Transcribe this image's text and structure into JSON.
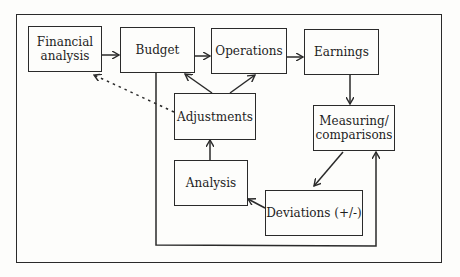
{
  "diagram": {
    "type": "flowchart",
    "nodes": {
      "financial_analysis": "Financial analysis",
      "budget": "Budget",
      "operations": "Operations",
      "earnings": "Earnings",
      "adjustments": "Adjustments",
      "measuring": "Measuring/ comparisons",
      "analysis": "Analysis",
      "deviations": "Deviations (+/-)"
    },
    "edges": [
      {
        "from": "Financial analysis",
        "to": "Budget",
        "style": "solid"
      },
      {
        "from": "Budget",
        "to": "Operations",
        "style": "solid"
      },
      {
        "from": "Operations",
        "to": "Earnings",
        "style": "solid"
      },
      {
        "from": "Earnings",
        "to": "Measuring/ comparisons",
        "style": "solid"
      },
      {
        "from": "Measuring/ comparisons",
        "to": "Deviations (+/-)",
        "style": "solid"
      },
      {
        "from": "Deviations (+/-)",
        "to": "Analysis",
        "style": "solid"
      },
      {
        "from": "Analysis",
        "to": "Adjustments",
        "style": "solid"
      },
      {
        "from": "Adjustments",
        "to": "Budget",
        "style": "solid"
      },
      {
        "from": "Adjustments",
        "to": "Operations",
        "style": "solid"
      },
      {
        "from": "Adjustments",
        "to": "Financial analysis",
        "style": "dotted"
      },
      {
        "from": "Budget",
        "to": "Measuring/ comparisons",
        "style": "solid"
      }
    ],
    "colors": {
      "line": "#2a2a2a",
      "background": "#fdfdfb"
    }
  }
}
